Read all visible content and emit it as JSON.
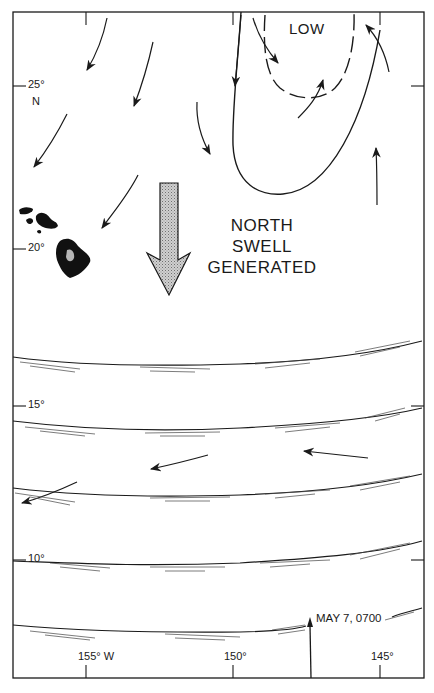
{
  "map": {
    "region": "Central North Pacific (Hawaiian Islands)",
    "frame": {
      "left": 13,
      "top": 12,
      "right": 424,
      "bottom": 678
    },
    "latitude_labels": [
      {
        "text": "25°",
        "sub": "N",
        "y": 86
      },
      {
        "text": "20°",
        "y": 249
      },
      {
        "text": "15°",
        "y": 406
      },
      {
        "text": "10°",
        "y": 560
      }
    ],
    "longitude_labels": [
      {
        "text": "155° W",
        "x": 86
      },
      {
        "text": "150°",
        "x": 233
      },
      {
        "text": "145°",
        "x": 380
      }
    ],
    "annotations": {
      "low": "LOW",
      "swell_line1": "NORTH",
      "swell_line2": "SWELL",
      "swell_line3": "GENERATED",
      "timestamp": "MAY 7, 0700"
    },
    "colors": {
      "ink": "#1a1a1a",
      "arrow_fill": "#b8b8b8",
      "background": "#ffffff"
    },
    "features": {
      "pressure_system": "Low-pressure isobars (solid outer, dashed inner) north-east of Hawaii",
      "swell_arrow": "Large stippled arrow pointing south",
      "wind_arrows_count": 12,
      "swell_front_lines": 5
    }
  }
}
